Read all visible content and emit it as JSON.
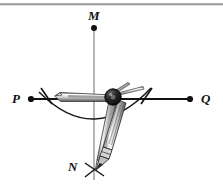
{
  "figure": {
    "background_color": "#ffffff",
    "stroke_color": "#111111",
    "top_rule_color": "#9a9a9a",
    "metal_light": "#f2f2f2",
    "metal_mid": "#b9b9b9",
    "metal_dark": "#4a4a4a",
    "pivot_color": "#1c1c1c",
    "labels": {
      "m": "M",
      "p": "P",
      "q": "Q",
      "n": "N"
    },
    "points": {
      "m": {
        "x": 94,
        "y": 27
      },
      "p": {
        "x": 31,
        "y": 99
      },
      "q": {
        "x": 190,
        "y": 99
      },
      "n": {
        "x": 94,
        "y": 172
      }
    },
    "lines": {
      "pq": {
        "x1": 31,
        "y1": 99,
        "x2": 190,
        "y2": 99
      },
      "mn": {
        "x1": 94,
        "y1": 27,
        "x2": 94,
        "y2": 180
      }
    },
    "arc": {
      "start_x": 39,
      "start_y": 92,
      "end_x": 151,
      "end_y": 88,
      "sag_y": 125
    },
    "compass": {
      "pivot_x": 113,
      "pivot_y": 97,
      "needle_tip_x": 55,
      "needle_tip_y": 98,
      "pencil_tip_x": 95,
      "pencil_tip_y": 168
    },
    "cross_mark": {
      "cx": 94,
      "cy": 170,
      "arm": 9
    }
  }
}
